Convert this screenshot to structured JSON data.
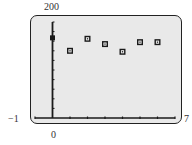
{
  "chart_data": {
    "type": "scatter",
    "title": "",
    "xlabel": "",
    "ylabel": "",
    "x": [
      0,
      1,
      2,
      3,
      4,
      5,
      6
    ],
    "values": [
      167,
      140,
      165,
      154,
      138,
      158,
      158
    ],
    "xlim": [
      -1,
      7
    ],
    "ylim": [
      0,
      200
    ],
    "x_tick_step": 1,
    "y_tick_step": 20,
    "grid": false,
    "legend": null,
    "marker": "square"
  },
  "labels": {
    "ymax": "200",
    "xmin": "−1",
    "xmax": "7",
    "origin": "0"
  },
  "colors": {
    "screen_bg": "#e9e9e9",
    "ink": "#1a1a1a"
  }
}
